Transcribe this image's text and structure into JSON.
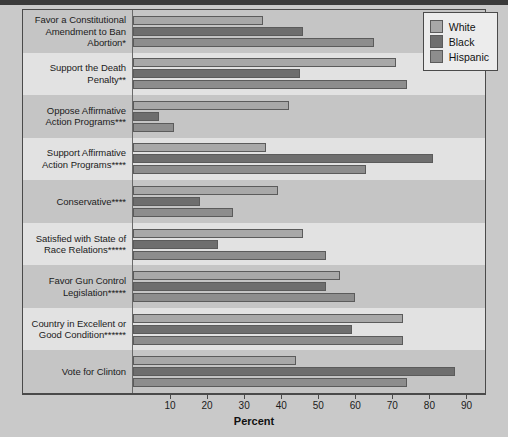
{
  "chart_data": {
    "type": "bar",
    "orientation": "horizontal",
    "title": "",
    "xlabel": "Percent",
    "ylabel": "",
    "xlim": [
      0,
      95
    ],
    "xticks": [
      10,
      20,
      30,
      40,
      50,
      60,
      70,
      80,
      90
    ],
    "grid": false,
    "legend_position": "top-right",
    "categories": [
      "Favor a Constitutional Amendment to Ban Abortion*",
      "Support the Death Penalty**",
      "Oppose Affirmative Action Programs***",
      "Support Affirmative Action Programs****",
      "Conservative****",
      "Satisfied with State of Race Relations*****",
      "Favor Gun Control Legislation*****",
      "Country in Excellent or Good Condition******",
      "Vote for Clinton"
    ],
    "series": [
      {
        "name": "White",
        "color": "#a8a8a8",
        "values": [
          35,
          71,
          42,
          36,
          39,
          46,
          56,
          73,
          44
        ]
      },
      {
        "name": "Black",
        "color": "#6e6e6e",
        "values": [
          46,
          45,
          7,
          81,
          18,
          23,
          52,
          59,
          87
        ]
      },
      {
        "name": "Hispanic",
        "color": "#8d8d8d",
        "values": [
          65,
          74,
          11,
          63,
          27,
          52,
          60,
          73,
          74
        ]
      }
    ]
  },
  "legend": {
    "items": [
      {
        "label": "White",
        "color": "#a8a8a8"
      },
      {
        "label": "Black",
        "color": "#6e6e6e"
      },
      {
        "label": "Hispanic",
        "color": "#8d8d8d"
      }
    ]
  },
  "axis": {
    "title": "Percent",
    "tick_labels": [
      "10",
      "20",
      "30",
      "40",
      "50",
      "60",
      "70",
      "80",
      "90"
    ]
  }
}
